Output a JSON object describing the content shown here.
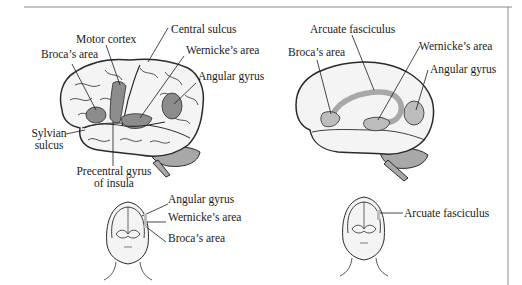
{
  "figure": {
    "left_panel": {
      "brain_labels": {
        "central_sulcus": "Central sulcus",
        "motor_cortex": "Motor cortex",
        "brocas_area": "Broca’s area",
        "wernickes_area": "Wernicke’s area",
        "angular_gyrus": "Angular gyrus",
        "sylvian_sulcus_line1": "Sylvian",
        "sylvian_sulcus_line2": "sulcus",
        "precentral_line1": "Precentral gyrus",
        "precentral_line2": "of insula"
      },
      "head_labels": {
        "angular_gyrus": "Angular gyrus",
        "wernickes_area": "Wernicke’s area",
        "brocas_area": "Broca’s area"
      }
    },
    "right_panel": {
      "brain_labels": {
        "arcuate_fasciculus": "Arcuate fasciculus",
        "brocas_area": "Broca’s area",
        "wernickes_area": "Wernicke’s area",
        "angular_gyrus": "Angular gyrus"
      },
      "head_labels": {
        "arcuate_fasciculus": "Arcuate fasciculus"
      }
    },
    "colors": {
      "brain_fill": "#f4f4f4",
      "outline": "#2a2a2a",
      "region_dark": "#8c8c8c",
      "region_light": "#bdbdbd",
      "cerebellum": "#a8a8a8",
      "frame_line": "#8a8a8a"
    }
  }
}
